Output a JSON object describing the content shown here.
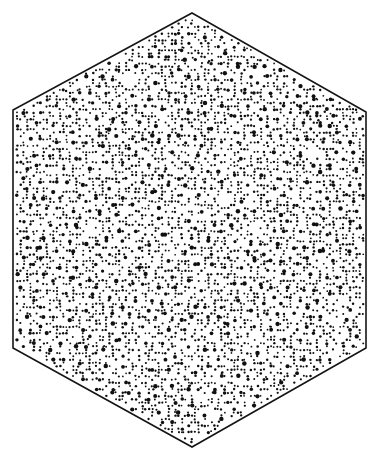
{
  "figure": {
    "canvas": {
      "width": 379,
      "height": 462,
      "background_color": "#ffffff"
    },
    "shape": {
      "name": "hexagon",
      "type": "polygon",
      "vertices": [
        [
          192,
          13
        ],
        [
          366,
          112
        ],
        [
          366,
          348
        ],
        [
          192,
          447
        ],
        [
          13,
          348
        ],
        [
          13,
          110
        ]
      ],
      "stroke_color": "#151515",
      "stroke_width": 1.6,
      "fill_color": "#ffffff"
    },
    "pattern": {
      "name": "quasicrystal-speckle-fill",
      "description": "Dense quasiperiodic field of small dark dots in two size classes arranged in rosette clusters",
      "dot_color": "#101010",
      "size_classes": [
        1.05,
        1.85
      ],
      "symmetry_order": 5,
      "lattice_spacing": 8.4,
      "seed": 20173,
      "density": 0.92
    }
  },
  "chart_data": {
    "type": "scatter",
    "subtitle": "",
    "xlabel": "",
    "ylabel": "",
    "xlim": [
      13,
      366
    ],
    "ylim": [
      13,
      447
    ],
    "grid": false,
    "legend": "none",
    "categories": [
      "small-dot",
      "large-dot"
    ],
    "series": [
      {
        "name": "small-dot",
        "marker": "circle",
        "size": 2.1,
        "color": "#101010"
      },
      {
        "name": "large-dot",
        "marker": "circle",
        "size": 3.7,
        "color": "#101010"
      }
    ],
    "boundary": {
      "name": "hexagon",
      "x": [
        192,
        366,
        366,
        192,
        13,
        13
      ],
      "y": [
        13,
        112,
        348,
        447,
        348,
        110
      ]
    },
    "annotations": []
  }
}
